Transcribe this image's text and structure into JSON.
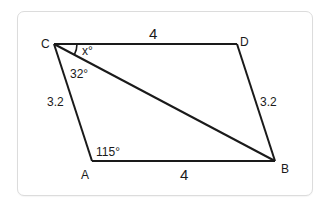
{
  "figure": {
    "type": "parallelogram",
    "vertices": {
      "A": {
        "label": "A",
        "x": 92,
        "y": 161
      },
      "B": {
        "label": "B",
        "x": 275,
        "y": 161
      },
      "C": {
        "label": "C",
        "x": 54,
        "y": 44
      },
      "D": {
        "label": "D",
        "x": 237,
        "y": 44
      }
    },
    "sides": {
      "CD": "4",
      "AB": "4",
      "CA": "3.2",
      "DB": "3.2"
    },
    "diagonal": "CB",
    "angles": {
      "DCB": "x°",
      "BCA": "32°",
      "CAB": "115°"
    },
    "colors": {
      "stroke": "#1a1a1a",
      "card_border": "#dcdcdc",
      "background": "#ffffff"
    }
  }
}
